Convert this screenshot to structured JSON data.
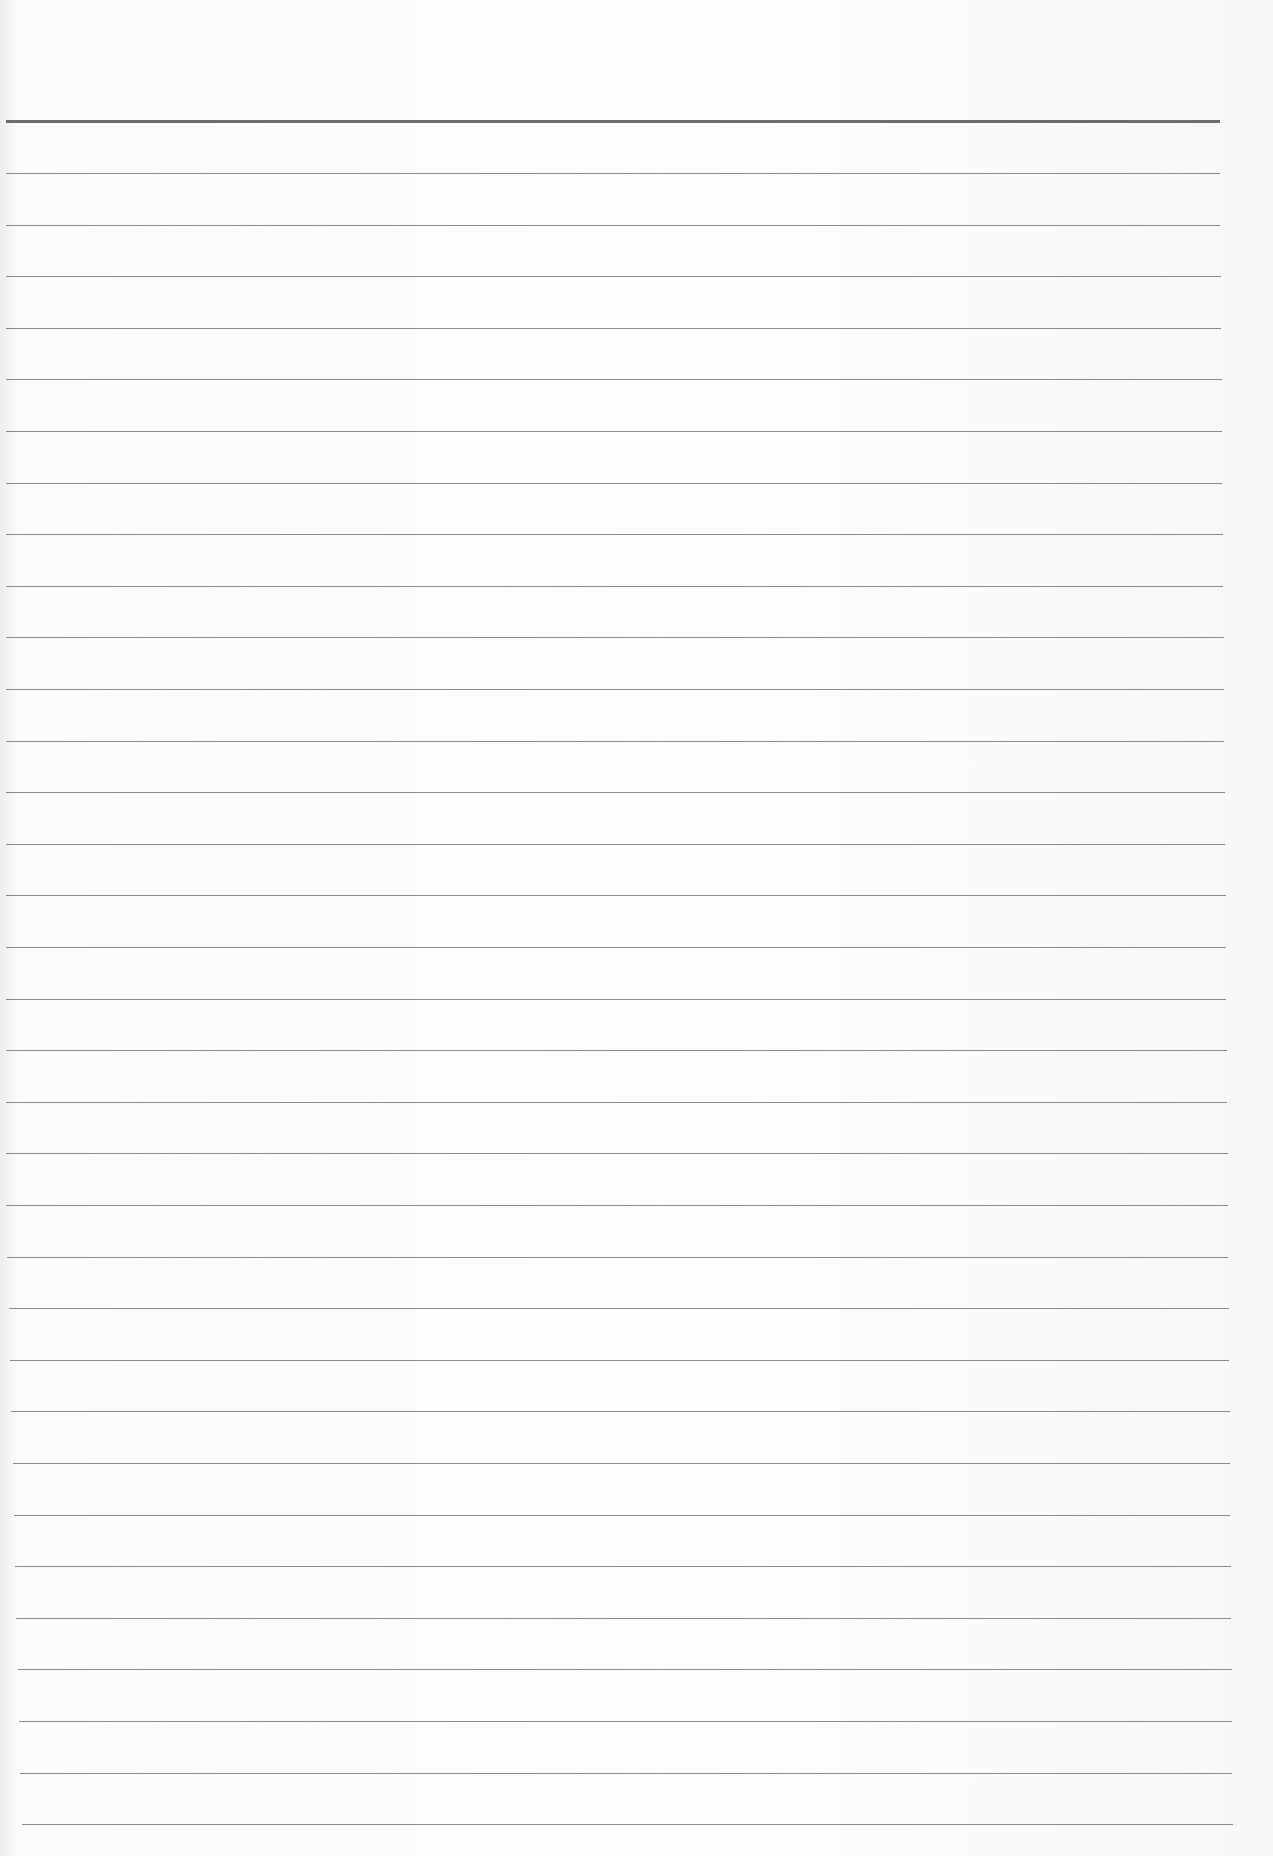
{
  "document": {
    "type": "blank lined paper",
    "header_rule": {
      "y": 120,
      "color": "#6d6d6d"
    },
    "rule_color": "#8a8a8a",
    "line_count": 33,
    "line_start_y": 173,
    "line_spacing": 51.6
  }
}
